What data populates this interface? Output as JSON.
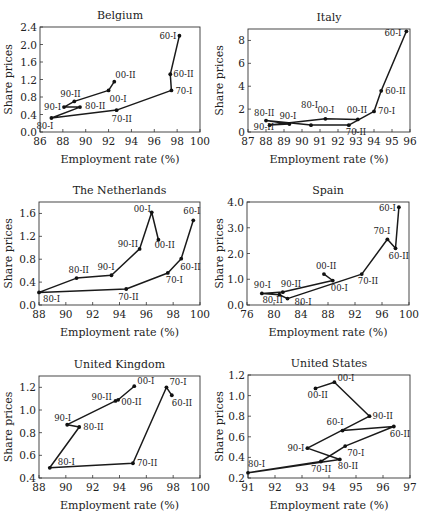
{
  "figure": {
    "panels_layout": "3 rows x 2 columns"
  },
  "chart_data": [
    {
      "type": "line",
      "title": "Belgium",
      "xlabel": "Employment rate (%)",
      "ylabel": "Share prices",
      "xlim": [
        86,
        100
      ],
      "ylim": [
        0.0,
        2.4
      ],
      "xticks": [
        "86",
        "88",
        "90",
        "92",
        "94",
        "96",
        "98",
        "100"
      ],
      "yticks": [
        "0.0",
        "0.4",
        "0.8",
        "1.2",
        "1.6",
        "2.0",
        "2.4"
      ],
      "points": [
        {
          "label": "60-I",
          "x": 98.2,
          "y": 2.2
        },
        {
          "label": "60-II",
          "x": 97.4,
          "y": 1.32
        },
        {
          "label": "70-I",
          "x": 97.5,
          "y": 0.95
        },
        {
          "label": "70-II",
          "x": 92.7,
          "y": 0.5
        },
        {
          "label": "80-I",
          "x": 87.0,
          "y": 0.32
        },
        {
          "label": "80-II",
          "x": 89.5,
          "y": 0.57
        },
        {
          "label": "90-I",
          "x": 88.1,
          "y": 0.57
        },
        {
          "label": "90-II",
          "x": 89.0,
          "y": 0.7
        },
        {
          "label": "00-I",
          "x": 92.0,
          "y": 0.95
        },
        {
          "label": "00-II",
          "x": 92.5,
          "y": 1.15
        }
      ]
    },
    {
      "type": "line",
      "title": "Italy",
      "xlabel": "Employment rate (%)",
      "ylabel": "Share prices",
      "xlim": [
        87,
        96
      ],
      "ylim": [
        0,
        9
      ],
      "xticks": [
        "87",
        "88",
        "89",
        "90",
        "91",
        "92",
        "93",
        "94",
        "95",
        "96"
      ],
      "yticks": [
        "0",
        "2",
        "4",
        "6",
        "8"
      ],
      "points": [
        {
          "label": "60-I",
          "x": 95.8,
          "y": 8.8
        },
        {
          "label": "60-II",
          "x": 94.4,
          "y": 3.6
        },
        {
          "label": "70-I",
          "x": 94.0,
          "y": 1.8
        },
        {
          "label": "70-II",
          "x": 92.6,
          "y": 0.6
        },
        {
          "label": "80-I",
          "x": 90.5,
          "y": 0.6
        },
        {
          "label": "80-II",
          "x": 88.0,
          "y": 1.0
        },
        {
          "label": "90-I",
          "x": 89.3,
          "y": 0.7
        },
        {
          "label": "90-II",
          "x": 88.2,
          "y": 0.6
        },
        {
          "label": "00-I",
          "x": 91.3,
          "y": 1.15
        },
        {
          "label": "00-II",
          "x": 93.1,
          "y": 1.1
        }
      ]
    },
    {
      "type": "line",
      "title": "The Netherlands",
      "xlabel": "Employment rate (%)",
      "ylabel": "Share prices",
      "xlim": [
        88,
        100
      ],
      "ylim": [
        0.0,
        1.8
      ],
      "xticks": [
        "88",
        "90",
        "92",
        "94",
        "96",
        "98",
        "100"
      ],
      "yticks": [
        "0.0",
        "0.4",
        "0.8",
        "1.2",
        "1.6"
      ],
      "points": [
        {
          "label": "60-I",
          "x": 99.5,
          "y": 1.48
        },
        {
          "label": "60-II",
          "x": 98.6,
          "y": 0.81
        },
        {
          "label": "70-I",
          "x": 97.6,
          "y": 0.56
        },
        {
          "label": "70-II",
          "x": 94.5,
          "y": 0.28
        },
        {
          "label": "80-I",
          "x": 88.0,
          "y": 0.22
        },
        {
          "label": "80-II",
          "x": 90.8,
          "y": 0.47
        },
        {
          "label": "90-I",
          "x": 93.4,
          "y": 0.52
        },
        {
          "label": "90-II",
          "x": 95.5,
          "y": 0.98
        },
        {
          "label": "00-I",
          "x": 96.4,
          "y": 1.62
        },
        {
          "label": "00-II",
          "x": 96.9,
          "y": 1.14
        }
      ]
    },
    {
      "type": "line",
      "title": "Spain",
      "xlabel": "Employment rate (%)",
      "ylabel": "Share prices",
      "xlim": [
        76,
        100
      ],
      "ylim": [
        0.0,
        4.0
      ],
      "xticks": [
        "76",
        "80",
        "84",
        "88",
        "92",
        "96",
        "100"
      ],
      "yticks": [
        "0.0",
        "1.0",
        "2.0",
        "3.0",
        "4.0"
      ],
      "points": [
        {
          "label": "60-I",
          "x": 98.5,
          "y": 3.8
        },
        {
          "label": "60-II",
          "x": 98.0,
          "y": 2.2
        },
        {
          "label": "70-I",
          "x": 96.8,
          "y": 2.55
        },
        {
          "label": "70-II",
          "x": 93.0,
          "y": 1.2
        },
        {
          "label": "80-I",
          "x": 82.0,
          "y": 0.25
        },
        {
          "label": "80-II",
          "x": 80.8,
          "y": 0.4
        },
        {
          "label": "90-I",
          "x": 78.2,
          "y": 0.45
        },
        {
          "label": "90-II",
          "x": 81.3,
          "y": 0.5
        },
        {
          "label": "00-I",
          "x": 88.7,
          "y": 0.95
        },
        {
          "label": "00-II",
          "x": 87.4,
          "y": 1.2
        }
      ]
    },
    {
      "type": "line",
      "title": "United Kingdom",
      "xlabel": "Employment rate (%)",
      "ylabel": "Share prices",
      "xlim": [
        88,
        100
      ],
      "ylim": [
        0.4,
        1.3
      ],
      "xticks": [
        "88",
        "90",
        "92",
        "94",
        "96",
        "98",
        "100"
      ],
      "yticks": [
        "0.4",
        "0.6",
        "0.8",
        "1.0",
        "1.2"
      ],
      "points": [
        {
          "label": "60-II",
          "x": 97.9,
          "y": 1.13
        },
        {
          "label": "70-I",
          "x": 97.5,
          "y": 1.2
        },
        {
          "label": "70-II",
          "x": 95.0,
          "y": 0.53
        },
        {
          "label": "80-I",
          "x": 88.8,
          "y": 0.49
        },
        {
          "label": "80-II",
          "x": 91.0,
          "y": 0.85
        },
        {
          "label": "90-I",
          "x": 90.1,
          "y": 0.87
        },
        {
          "label": "90-II",
          "x": 93.7,
          "y": 1.08
        },
        {
          "label": "00-II",
          "x": 93.9,
          "y": 1.09
        },
        {
          "label": "00-I",
          "x": 95.1,
          "y": 1.21
        }
      ]
    },
    {
      "type": "line",
      "title": "United States",
      "xlabel": "Employment rate (%)",
      "ylabel": "Share prices",
      "xlim": [
        91,
        97
      ],
      "ylim": [
        0.2,
        1.2
      ],
      "xticks": [
        "91",
        "92",
        "93",
        "94",
        "95",
        "96",
        "97"
      ],
      "yticks": [
        "0.2",
        "0.4",
        "0.6",
        "0.8",
        "1.0",
        "1.2"
      ],
      "points": [
        {
          "label": "60-I",
          "x": 94.5,
          "y": 0.66
        },
        {
          "label": "60-II",
          "x": 96.4,
          "y": 0.7
        },
        {
          "label": "70-I",
          "x": 94.6,
          "y": 0.51
        },
        {
          "label": "70-II",
          "x": 93.7,
          "y": 0.36
        },
        {
          "label": "80-I",
          "x": 91.0,
          "y": 0.25
        },
        {
          "label": "80-II",
          "x": 94.4,
          "y": 0.38
        },
        {
          "label": "90-I",
          "x": 93.2,
          "y": 0.49
        },
        {
          "label": "90-II",
          "x": 95.5,
          "y": 0.8
        },
        {
          "label": "00-I",
          "x": 94.2,
          "y": 1.13
        },
        {
          "label": "00-II",
          "x": 93.5,
          "y": 1.07
        }
      ]
    }
  ],
  "layout": {
    "panels": [
      {
        "left": 0,
        "top": 0,
        "plot": [
          40,
          27,
          200,
          132
        ],
        "label_offsets": {
          "60-I": [
            -20,
            3
          ],
          "60-II": [
            3,
            3
          ],
          "70-I": [
            4,
            4
          ],
          "70-II": [
            -5,
            12
          ],
          "80-I": [
            -15,
            11
          ],
          "80-II": [
            5,
            2
          ],
          "90-I": [
            -20,
            3
          ],
          "90-II": [
            -14,
            -4
          ],
          "00-I": [
            1,
            12
          ],
          "00-II": [
            1,
            -4
          ]
        }
      },
      {
        "left": 211,
        "top": 0,
        "plot": [
          37,
          29,
          199,
          132
        ],
        "label_offsets": {
          "60-I": [
            -22,
            5
          ],
          "60-II": [
            4,
            3
          ],
          "70-I": [
            4,
            3
          ],
          "70-II": [
            -3,
            10
          ],
          "80-I": [
            -10,
            -17
          ],
          "80-II": [
            -12,
            -5
          ],
          "90-I": [
            -10,
            -5
          ],
          "90-II": [
            -16,
            5
          ],
          "00-I": [
            -8,
            -6
          ],
          "00-II": [
            -11,
            -6
          ]
        }
      },
      {
        "left": 0,
        "top": 172,
        "plot": [
          39,
          30,
          200,
          133
        ],
        "label_offsets": {
          "60-I": [
            -10,
            -6
          ],
          "60-II": [
            -1,
            11
          ],
          "70-I": [
            -2,
            10
          ],
          "70-II": [
            -8,
            11
          ],
          "80-I": [
            4,
            10
          ],
          "80-II": [
            -8,
            -5
          ],
          "90-I": [
            -14,
            -5
          ],
          "90-II": [
            -22,
            -2
          ],
          "00-I": [
            -18,
            0
          ],
          "00-II": [
            -4,
            8
          ]
        }
      },
      {
        "left": 211,
        "top": 172,
        "plot": [
          36,
          30,
          198,
          133
        ],
        "label_offsets": {
          "60-I": [
            -20,
            4
          ],
          "60-II": [
            -7,
            11
          ],
          "70-I": [
            -14,
            -5
          ],
          "70-II": [
            -4,
            10
          ],
          "80-I": [
            7,
            6
          ],
          "80-II": [
            -17,
            8
          ],
          "90-I": [
            -8,
            -5
          ],
          "90-II": [
            -2,
            -5
          ],
          "00-I": [
            -2,
            10
          ],
          "00-II": [
            -8,
            -5
          ]
        }
      },
      {
        "left": 0,
        "top": 343,
        "plot": [
          39,
          33,
          200,
          135
        ],
        "label_offsets": {
          "60-I": [
            0,
            0
          ],
          "60-II": [
            0,
            11
          ],
          "70-I": [
            3,
            -2
          ],
          "70-II": [
            4,
            3
          ],
          "80-I": [
            8,
            -3
          ],
          "80-II": [
            4,
            3
          ],
          "90-I": [
            -13,
            -4
          ],
          "90-II": [
            -24,
            -1
          ],
          "00-II": [
            3,
            5
          ],
          "00-I": [
            3,
            -2
          ]
        }
      },
      {
        "left": 211,
        "top": 343,
        "plot": [
          37,
          32,
          199,
          135
        ],
        "label_offsets": {
          "60-I": [
            -16,
            -6
          ],
          "60-II": [
            -4,
            10
          ],
          "70-I": [
            2,
            10
          ],
          "70-II": [
            -10,
            10
          ],
          "80-I": [
            0,
            -6
          ],
          "80-II": [
            -2,
            10
          ],
          "90-I": [
            -20,
            3
          ],
          "90-II": [
            3,
            3
          ],
          "00-I": [
            3,
            -1
          ],
          "00-II": [
            -8,
            10
          ]
        }
      }
    ]
  }
}
